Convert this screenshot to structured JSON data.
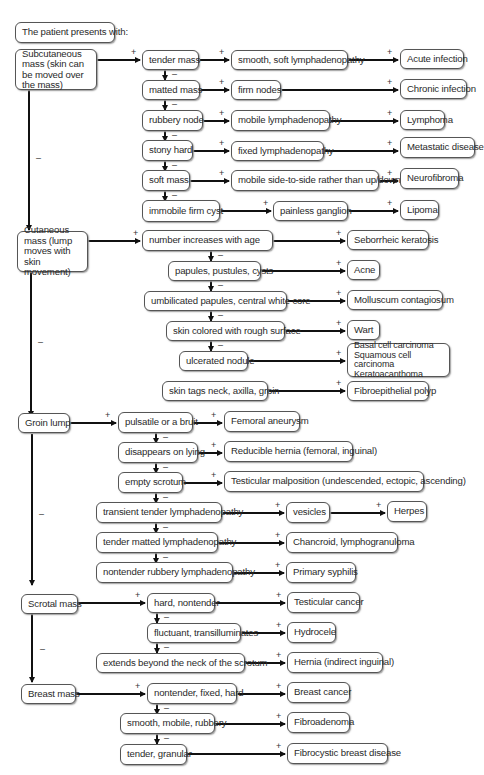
{
  "title": "The patient presents with:",
  "categories": [
    {
      "label": "Subcutaneous mass (skin can be moved over the mass)",
      "findings": [
        {
          "label": "tender mass",
          "next": "smooth, soft lymphadenopathy",
          "diagnosis": "Acute infection"
        },
        {
          "label": "matted mass",
          "next": "firm nodes",
          "diagnosis": "Chronic infection"
        },
        {
          "label": "rubbery node",
          "next": "mobile lymphadenopathy",
          "diagnosis": "Lymphoma"
        },
        {
          "label": "stony hard",
          "next": "fixed lymphadenopathy",
          "diagnosis": "Metastatic disease"
        },
        {
          "label": "soft mass",
          "next": "mobile side-to-side rather than up/down",
          "diagnosis": "Neurofibroma"
        },
        {
          "label": "immobile firm cyst",
          "next": "painless ganglion",
          "diagnosis": "Lipoma"
        }
      ]
    },
    {
      "label": "Cutaneous mass (lump moves with skin movement)",
      "findings": [
        {
          "label": "number increases with age",
          "diagnosis": "Seborrheic keratosis"
        },
        {
          "label": "papules, pustules, cysts",
          "diagnosis": "Acne"
        },
        {
          "label": "umbilicated papules, central white core",
          "diagnosis": "Molluscum contagiosum"
        },
        {
          "label": "skin colored with rough surface",
          "diagnosis": "Wart"
        },
        {
          "label": "ulcerated nodule",
          "diagnosis": "Basal cell carcinoma Squamous cell carcinoma Keratoacanthoma"
        },
        {
          "label": "skin tags neck, axilla, groin",
          "diagnosis": "Fibroepithelial polyp"
        }
      ]
    },
    {
      "label": "Groin lump",
      "findings": [
        {
          "label": "pulsatile or a bruit",
          "diagnosis": "Femoral aneurysm"
        },
        {
          "label": "disappears on lying",
          "diagnosis": "Reducible hernia (femoral, inguinal)"
        },
        {
          "label": "empty scrotum",
          "diagnosis": "Testicular malposition (undescended, ectopic, ascending)"
        },
        {
          "label": "transient tender lymphadenopathy",
          "next": "vesicles",
          "diagnosis": "Herpes"
        },
        {
          "label": "tender matted lymphadenopathy",
          "diagnosis": "Chancroid, lymphogranuloma"
        },
        {
          "label": "nontender rubbery lymphadenopathy",
          "diagnosis": "Primary syphilis"
        }
      ]
    },
    {
      "label": "Scrotal mass",
      "findings": [
        {
          "label": "hard, nontender",
          "diagnosis": "Testicular cancer"
        },
        {
          "label": "fluctuant, transilluminates",
          "diagnosis": "Hydrocele"
        },
        {
          "label": "extends beyond the neck of the scrotum",
          "diagnosis": "Hernia (indirect inguinal)"
        }
      ]
    },
    {
      "label": "Breast mass",
      "findings": [
        {
          "label": "nontender, fixed, hard",
          "diagnosis": "Breast cancer"
        },
        {
          "label": "smooth, mobile, rubbery",
          "diagnosis": "Fibroadenoma"
        },
        {
          "label": "tender, granular",
          "diagnosis": "Fibrocystic breast disease"
        }
      ]
    }
  ],
  "signs": {
    "positive": "+",
    "negative": "–"
  }
}
